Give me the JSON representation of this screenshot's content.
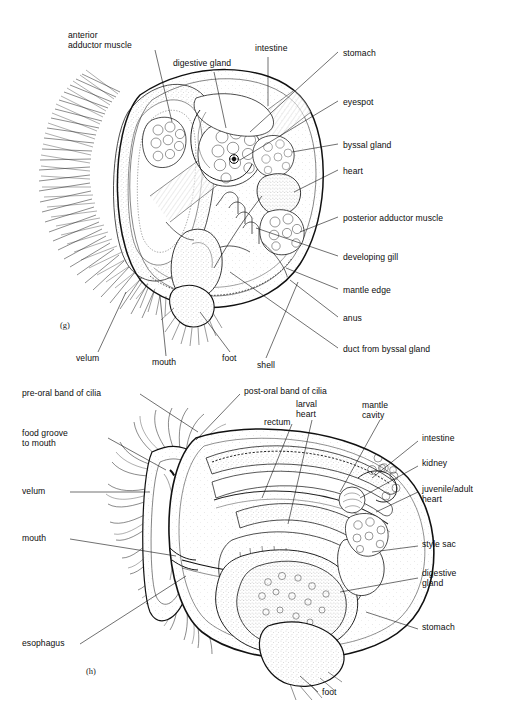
{
  "figure": {
    "title_faint": "",
    "panels": [
      {
        "id": "g",
        "marker": "(g)",
        "caption_subject": "late veliger larva of a bivalve, internal anatomy",
        "labels": [
          {
            "key": "anterior_adductor_muscle",
            "text": "anterior\nadductor muscle",
            "x": 68,
            "y": 30,
            "align": "left"
          },
          {
            "key": "digestive_gland",
            "text": "digestive gland",
            "x": 173,
            "y": 58,
            "align": "left"
          },
          {
            "key": "intestine",
            "text": "intestine",
            "x": 255,
            "y": 43,
            "align": "left"
          },
          {
            "key": "stomach",
            "text": "stomach",
            "x": 343,
            "y": 48,
            "align": "left"
          },
          {
            "key": "eyespot",
            "text": "eyespot",
            "x": 343,
            "y": 97,
            "align": "left"
          },
          {
            "key": "byssal_gland",
            "text": "byssal gland",
            "x": 343,
            "y": 140,
            "align": "left"
          },
          {
            "key": "heart",
            "text": "heart",
            "x": 343,
            "y": 166,
            "align": "left"
          },
          {
            "key": "posterior_adductor_muscle",
            "text": "posterior adductor muscle",
            "x": 343,
            "y": 213,
            "align": "left"
          },
          {
            "key": "developing_gill",
            "text": "developing gill",
            "x": 343,
            "y": 252,
            "align": "left"
          },
          {
            "key": "mantle_edge",
            "text": "mantle edge",
            "x": 343,
            "y": 285,
            "align": "left"
          },
          {
            "key": "anus",
            "text": "anus",
            "x": 343,
            "y": 313,
            "align": "left"
          },
          {
            "key": "duct_from_byssal_gland",
            "text": "duct from byssal gland",
            "x": 343,
            "y": 344,
            "align": "left"
          },
          {
            "key": "velum",
            "text": "velum",
            "x": 76,
            "y": 358,
            "align": "left"
          },
          {
            "key": "mouth",
            "text": "mouth",
            "x": 152,
            "y": 362,
            "align": "left"
          },
          {
            "key": "foot",
            "text": "foot",
            "x": 222,
            "y": 358,
            "align": "left"
          },
          {
            "key": "shell",
            "text": "shell",
            "x": 257,
            "y": 365,
            "align": "left"
          }
        ]
      },
      {
        "id": "h",
        "marker": "(h)",
        "caption_subject": "pediveliger larva of a bivalve, internal anatomy",
        "labels": [
          {
            "key": "pre_oral_band_of_cilia",
            "text": "pre-oral band of cilia",
            "x": 22,
            "y": 392,
            "align": "left"
          },
          {
            "key": "post_oral_band_of_cilia",
            "text": "post-oral band of cilia",
            "x": 244,
            "y": 390,
            "align": "left"
          },
          {
            "key": "food_groove_to_mouth",
            "text": "food groove\nto mouth",
            "x": 22,
            "y": 431,
            "align": "left"
          },
          {
            "key": "rectum",
            "text": "rectum",
            "x": 264,
            "y": 421,
            "align": "left"
          },
          {
            "key": "larval_heart",
            "text": "larval\nheart",
            "x": 296,
            "y": 403,
            "align": "left"
          },
          {
            "key": "mantle_cavity",
            "text": "mantle\ncavity",
            "x": 362,
            "y": 404,
            "align": "left"
          },
          {
            "key": "intestine",
            "text": "intestine",
            "x": 422,
            "y": 437,
            "align": "left"
          },
          {
            "key": "kidney",
            "text": "kidney",
            "x": 422,
            "y": 462,
            "align": "left"
          },
          {
            "key": "juvenile_adult_heart",
            "text": "juvenile/adult\nheart",
            "x": 422,
            "y": 491,
            "align": "left"
          },
          {
            "key": "velum",
            "text": "velum",
            "x": 22,
            "y": 490,
            "align": "left"
          },
          {
            "key": "mouth",
            "text": "mouth",
            "x": 22,
            "y": 536,
            "align": "left"
          },
          {
            "key": "style_sac",
            "text": "style sac",
            "x": 422,
            "y": 542,
            "align": "left"
          },
          {
            "key": "digestive_gland",
            "text": "digestive\ngland",
            "x": 422,
            "y": 575,
            "align": "left"
          },
          {
            "key": "esophagus",
            "text": "esophagus",
            "x": 22,
            "y": 642,
            "align": "left"
          },
          {
            "key": "stomach",
            "text": "stomach",
            "x": 422,
            "y": 625,
            "align": "left"
          },
          {
            "key": "foot",
            "text": "foot",
            "x": 322,
            "y": 690,
            "align": "left"
          }
        ]
      }
    ],
    "colors": {
      "ink": "#111111",
      "paper": "#ffffff",
      "stipple": "#4a4a4a"
    }
  }
}
